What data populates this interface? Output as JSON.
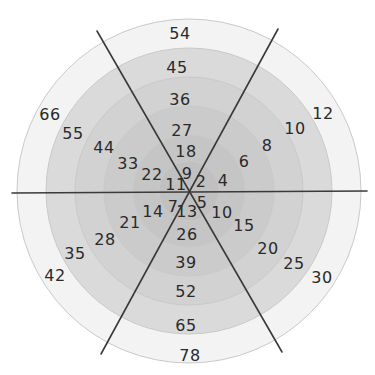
{
  "diagram": {
    "type": "multiplication-target-wheel",
    "center": [
      189,
      191
    ],
    "rings": [
      {
        "radius": 172,
        "fill": "#f3f3f3"
      },
      {
        "radius": 143,
        "fill": "#dadada"
      },
      {
        "radius": 114,
        "fill": "#d2d2d2"
      },
      {
        "radius": 85,
        "fill": "#cbcbcb"
      },
      {
        "radius": 56,
        "fill": "#c5c5c5"
      },
      {
        "radius": 30,
        "fill": "#c0c0c0"
      }
    ],
    "spokes": [
      {
        "x1": 12,
        "y1": 193,
        "x2": 367,
        "y2": 191
      },
      {
        "x1": 97,
        "y1": 31,
        "x2": 282,
        "y2": 352
      },
      {
        "x1": 278,
        "y1": 29,
        "x2": 101,
        "y2": 354
      }
    ],
    "sectors": [
      {
        "name": "top",
        "factor": 9,
        "labels": [
          {
            "text": "9",
            "x": 187,
            "y": 174
          },
          {
            "text": "18",
            "x": 186,
            "y": 152
          },
          {
            "text": "27",
            "x": 182,
            "y": 131
          },
          {
            "text": "36",
            "x": 180,
            "y": 100
          },
          {
            "text": "45",
            "x": 177,
            "y": 68
          },
          {
            "text": "54",
            "x": 180,
            "y": 34
          }
        ]
      },
      {
        "name": "upper-right",
        "factor": 2,
        "labels": [
          {
            "text": "2",
            "x": 201,
            "y": 182
          },
          {
            "text": "4",
            "x": 223,
            "y": 181
          },
          {
            "text": "6",
            "x": 244,
            "y": 162
          },
          {
            "text": "8",
            "x": 267,
            "y": 146
          },
          {
            "text": "10",
            "x": 295,
            "y": 129
          },
          {
            "text": "12",
            "x": 323,
            "y": 114
          }
        ]
      },
      {
        "name": "lower-right",
        "factor": 5,
        "labels": [
          {
            "text": "5",
            "x": 202,
            "y": 203
          },
          {
            "text": "10",
            "x": 222,
            "y": 213
          },
          {
            "text": "15",
            "x": 244,
            "y": 226
          },
          {
            "text": "20",
            "x": 268,
            "y": 249
          },
          {
            "text": "25",
            "x": 294,
            "y": 264
          },
          {
            "text": "30",
            "x": 322,
            "y": 278
          }
        ]
      },
      {
        "name": "bottom",
        "factor": 13,
        "labels": [
          {
            "text": "13",
            "x": 187,
            "y": 212
          },
          {
            "text": "26",
            "x": 187,
            "y": 235
          },
          {
            "text": "39",
            "x": 186,
            "y": 263
          },
          {
            "text": "52",
            "x": 186,
            "y": 292
          },
          {
            "text": "65",
            "x": 186,
            "y": 326
          },
          {
            "text": "78",
            "x": 190,
            "y": 356
          }
        ]
      },
      {
        "name": "lower-left",
        "factor": 7,
        "labels": [
          {
            "text": "7",
            "x": 173,
            "y": 207
          },
          {
            "text": "14",
            "x": 153,
            "y": 212
          },
          {
            "text": "21",
            "x": 130,
            "y": 223
          },
          {
            "text": "28",
            "x": 105,
            "y": 240
          },
          {
            "text": "35",
            "x": 75,
            "y": 254
          },
          {
            "text": "42",
            "x": 55,
            "y": 276
          }
        ]
      },
      {
        "name": "upper-left",
        "factor": 11,
        "labels": [
          {
            "text": "11",
            "x": 176,
            "y": 185
          },
          {
            "text": "22",
            "x": 152,
            "y": 175
          },
          {
            "text": "33",
            "x": 128,
            "y": 164
          },
          {
            "text": "44",
            "x": 104,
            "y": 148
          },
          {
            "text": "55",
            "x": 73,
            "y": 134
          },
          {
            "text": "66",
            "x": 50,
            "y": 115
          }
        ]
      }
    ]
  }
}
